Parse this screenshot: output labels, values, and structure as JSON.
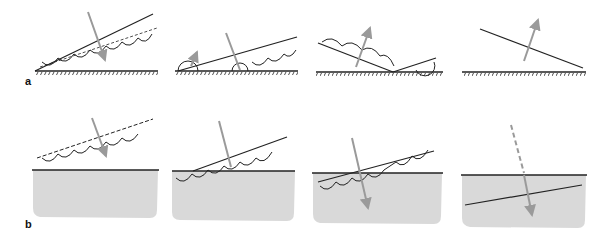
{
  "figure": {
    "row_labels": {
      "a": "a",
      "b": "b"
    },
    "colors": {
      "line": "#222222",
      "arrow": "#9a9a9a",
      "fill": "#d9d9d9"
    },
    "rows": [
      {
        "label": "a",
        "panels": [
          {
            "id": "a1",
            "description": "inclined double line with arcs above a hatched surface, arrow pointing down through it"
          },
          {
            "id": "a2",
            "description": "line touching surface, arcs and arrows rising"
          },
          {
            "id": "a3",
            "description": "V-shaped reflection with arcs, arrow upward"
          },
          {
            "id": "a4",
            "description": "single inclined line with upward arrow"
          }
        ]
      },
      {
        "label": "b",
        "panels": [
          {
            "id": "b1",
            "description": "inclined line with arcs above a gray medium, arrow down"
          },
          {
            "id": "b2",
            "description": "line meeting medium surface, arcs across boundary"
          },
          {
            "id": "b3",
            "description": "line crossing into medium, arrow refracted downward"
          },
          {
            "id": "b4",
            "description": "dashed arrow entering medium, refracted line inside"
          }
        ]
      }
    ]
  }
}
